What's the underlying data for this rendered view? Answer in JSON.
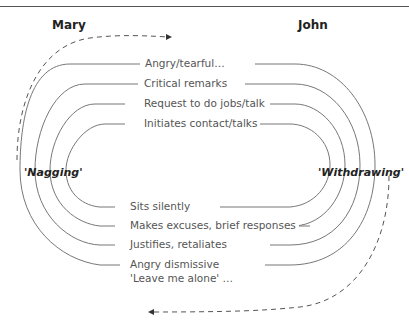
{
  "people": {
    "left": "Mary",
    "right": "John"
  },
  "patterns": {
    "left": "'Nagging'",
    "right": "'Withdrawing'"
  },
  "mary_behaviours": [
    "Angry/tearful…",
    "Critical remarks",
    "Request to do jobs/talk",
    "Initiates contact/talks"
  ],
  "john_behaviours": [
    "Sits silently",
    "Makes excuses, brief responses",
    "Justifies, retaliates",
    "Angry dismissive"
  ],
  "john_behaviour_continuation": "'Leave me alone' …",
  "colors": {
    "line": "#666666",
    "text": "#555555",
    "heading": "#222222"
  }
}
